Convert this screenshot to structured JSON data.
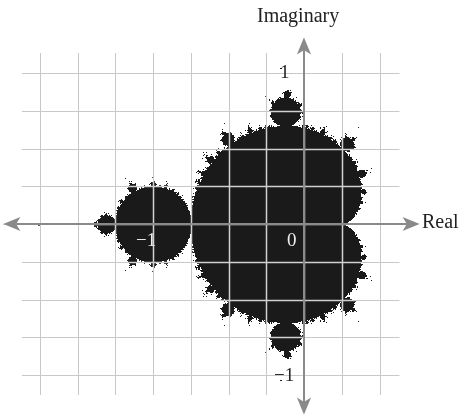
{
  "figure": {
    "axes": {
      "x_label": "Real",
      "y_label": "Imaginary",
      "ticks": {
        "real_neg1": "−1",
        "real_0": "0",
        "imag_pos1": "1",
        "imag_neg1": "−1"
      }
    },
    "grid": {
      "spacing_units": 0.25,
      "x_range": [
        -1.75,
        0.5
      ],
      "y_range": [
        -1.0,
        1.0
      ]
    },
    "colors": {
      "set": "#1a1a1a",
      "grid": "#c8c8c8",
      "axis": "#8a8a8a",
      "grid_over_set": "#d0d0d0"
    },
    "mapping": {
      "origin_px": [
        304,
        224
      ],
      "px_per_unit": 151
    }
  }
}
